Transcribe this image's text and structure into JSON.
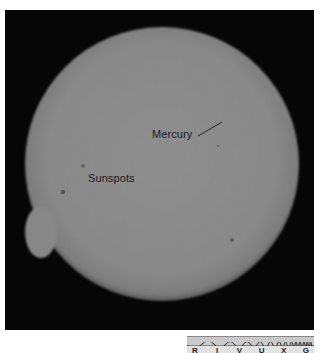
{
  "image": {
    "description": "Black-and-white photograph of the Sun showing a transit of Mercury and sunspots",
    "frame_color": "#060606",
    "sun_color": "#8b8b8b"
  },
  "annotations": {
    "mercury_label": "Mercury",
    "sunspots_label": "Sunspots"
  },
  "spectrum_strip": {
    "letters": [
      "R",
      "I",
      "V",
      "U",
      "X",
      "G"
    ],
    "band_color": "#c9c9c9"
  }
}
